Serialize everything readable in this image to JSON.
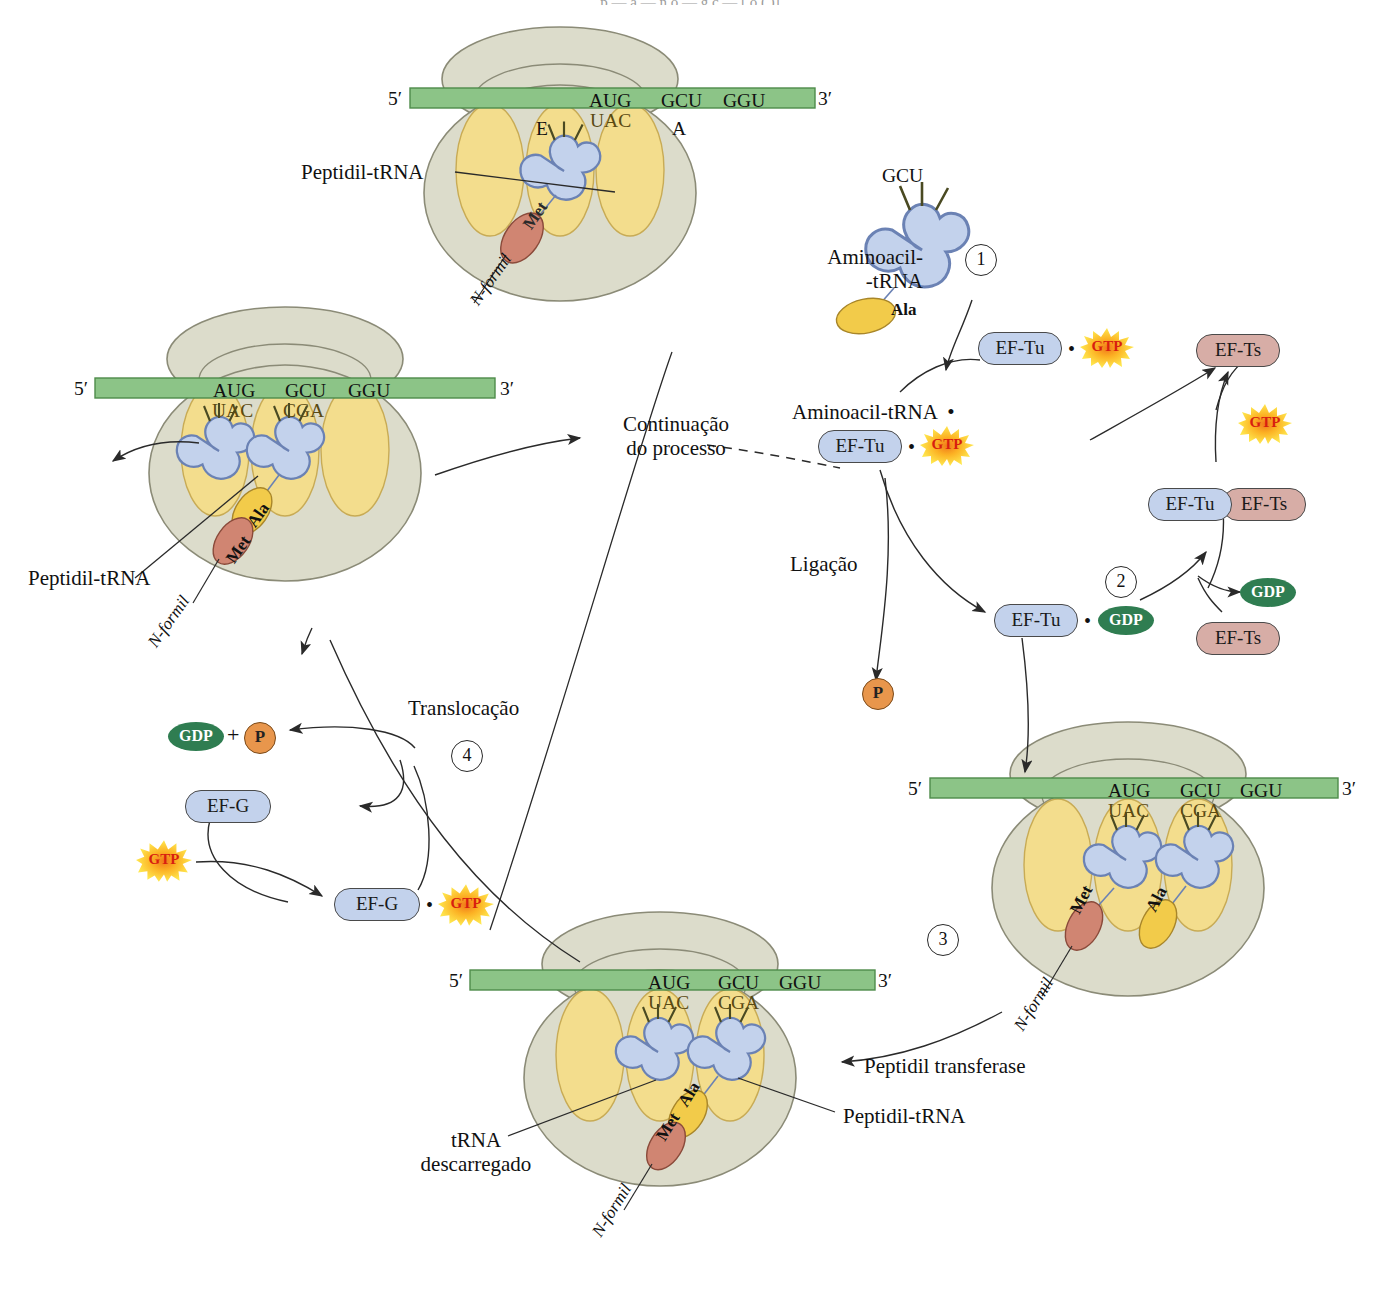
{
  "figure": {
    "title_cut_fragment": "p  —  a  —  n    o  —  g ç  —   [ o      (  )]",
    "language": "pt-BR",
    "topic": "Elongation cycle of protein synthesis (translation) in bacteria"
  },
  "palette": {
    "ribosome_body": "#dcdccb",
    "ribosome_outline": "#8b8b77",
    "site_yellow": "#f3dd8d",
    "site_outline": "#c8ab55",
    "mrna_green": "#8cc487",
    "mrna_outline": "#4e8c4a",
    "trna_blue": "#c3d2ec",
    "trna_outline": "#6b82b4",
    "met_salmon": "#d08572",
    "ala_gold": "#f2cb4a",
    "eftu_blue": "#c3d2ec",
    "efts_rose": "#d7ada6",
    "gdp_green": "#2f7d51",
    "phosphate_orange": "#e8964c",
    "gtp_burst_outer": "#ffe24a",
    "gtp_burst_inner": "#f07c1e",
    "gtp_text_red": "#d81f10",
    "stroke": "#2a2a2a"
  },
  "labels": {
    "peptidil_trna": "Peptidil-tRNA",
    "aminoacil_trna_line1": "Aminoacil-",
    "aminoacil_trna_line2": "-tRNA",
    "aminoacil_trna_complex": "Aminoacil-tRNA  •",
    "continuacao_line1": "Continuação",
    "continuacao_line2": "do processo",
    "ligacao": "Ligação",
    "translocacao": "Translocação",
    "peptidil_transferase": "Peptidil transferase",
    "trna_descarregado_line1": "tRNA",
    "trna_descarregado_line2": "descarregado",
    "n_formil": "N-formil",
    "dot": "•",
    "plus": "+"
  },
  "steps": [
    {
      "id": 1,
      "glyph": "1"
    },
    {
      "id": 2,
      "glyph": "2"
    },
    {
      "id": 3,
      "glyph": "3"
    },
    {
      "id": 4,
      "glyph": "4"
    }
  ],
  "molecules": {
    "eftu": "EF-Tu",
    "efts": "EF-Ts",
    "efg": "EF-G",
    "gtp": "GTP",
    "gdp": "GDP",
    "phosphate": "P",
    "met": "Met",
    "ala": "Ala"
  },
  "mrna": {
    "five_prime": "5′",
    "three_prime": "3′",
    "codons": [
      "AUG",
      "GCU",
      "GGU"
    ]
  },
  "anticodons": {
    "met_trna": "UAC",
    "ala_trna": "CGA"
  },
  "ribosome_sites": {
    "e_site": "E",
    "p_site": "P",
    "a_site": "A"
  },
  "ribosomes": [
    {
      "name": "top-ribosome-initiation",
      "position": "top-center",
      "sites_shown": [
        "E",
        "",
        "A"
      ],
      "codons": [
        "AUG",
        "GCU",
        "GGU"
      ],
      "trnas": [
        {
          "site": "P",
          "anticodon": "UAC",
          "amino_acid": "Met",
          "prefix": "N-formil"
        }
      ],
      "callouts": [
        "Peptidil-tRNA"
      ]
    },
    {
      "name": "right-ribosome-peptidyl-transferase",
      "position": "right-bottom",
      "codons": [
        "AUG",
        "GCU",
        "GGU"
      ],
      "trnas": [
        {
          "site": "P",
          "anticodon": "UAC",
          "amino_acid": "Met",
          "prefix": "N-formil"
        },
        {
          "site": "A",
          "anticodon": "CGA",
          "amino_acid": "Ala",
          "prefix": ""
        }
      ],
      "callouts": []
    },
    {
      "name": "bottom-ribosome-after-peptide-bond",
      "position": "bottom-center",
      "codons": [
        "AUG",
        "GCU",
        "GGU"
      ],
      "trnas": [
        {
          "site": "P",
          "anticodon": "UAC",
          "amino_acid": "",
          "prefix": ""
        },
        {
          "site": "A",
          "anticodon": "CGA",
          "amino_acid": "Ala",
          "prefix": "N-formil",
          "chain": [
            "Met",
            "Ala"
          ]
        }
      ],
      "callouts": [
        "tRNA descarregado",
        "Peptidil-tRNA"
      ]
    },
    {
      "name": "left-ribosome-after-translocation",
      "position": "left-middle",
      "codons": [
        "AUG",
        "GCU",
        "GGU"
      ],
      "trnas": [
        {
          "site": "E",
          "anticodon": "UAC",
          "amino_acid": "",
          "prefix": ""
        },
        {
          "site": "P",
          "anticodon": "CGA",
          "amino_acid": "Ala",
          "prefix": "N-formil",
          "chain": [
            "Met",
            "Ala"
          ]
        }
      ],
      "callouts": [
        "Peptidil-tRNA"
      ]
    }
  ],
  "eftu_cycle": {
    "free_aminoacyl_trna": {
      "anticodon": "CGA",
      "amino_acid": "Ala",
      "label": "Aminoacil-\n-tRNA"
    },
    "nodes": [
      {
        "id": "eftu-gtp-free",
        "parts": [
          "EF-Tu",
          "•",
          "GTP"
        ]
      },
      {
        "id": "aa-trna-eftu-gtp",
        "parts": [
          "Aminoacil-tRNA",
          "•",
          "EF-Tu",
          "•",
          "GTP"
        ]
      },
      {
        "id": "eftu-gdp",
        "parts": [
          "EF-Tu",
          "•",
          "GDP"
        ]
      },
      {
        "id": "eftu-efts",
        "parts": [
          "EF-Tu",
          "EF-Ts"
        ]
      },
      {
        "id": "efts-free",
        "parts": [
          "EF-Ts"
        ]
      },
      {
        "id": "efts-released",
        "parts": [
          "EF-Ts"
        ]
      },
      {
        "id": "gdp-released",
        "parts": [
          "GDP"
        ]
      },
      {
        "id": "gtp-incoming",
        "parts": [
          "GTP"
        ]
      },
      {
        "id": "gtp-to-eftu",
        "parts": [
          "GTP"
        ]
      },
      {
        "id": "phosphate-released",
        "parts": [
          "P"
        ]
      }
    ]
  },
  "efg_cycle": {
    "nodes": [
      {
        "id": "gdp-plus-p",
        "parts": [
          "GDP",
          "+",
          "P"
        ]
      },
      {
        "id": "efg-free",
        "parts": [
          "EF-G"
        ]
      },
      {
        "id": "gtp-free",
        "parts": [
          "GTP"
        ]
      },
      {
        "id": "efg-gtp",
        "parts": [
          "EF-G",
          "•",
          "GTP"
        ]
      }
    ]
  }
}
